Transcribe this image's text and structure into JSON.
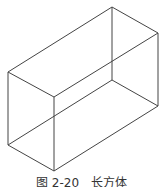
{
  "figure": {
    "stroke": "#444444",
    "vertices": {
      "top_left": [
        8,
        72
      ],
      "top_back": [
        112,
        7
      ],
      "top_right": [
        158,
        33
      ],
      "top_front": [
        54,
        97
      ],
      "bottom_left": [
        8,
        145
      ],
      "bottom_back": [
        112,
        80
      ],
      "bottom_right": [
        158,
        106
      ],
      "bottom_front": [
        54,
        171
      ]
    },
    "edges": [
      [
        "top_left",
        "top_back"
      ],
      [
        "top_back",
        "top_right"
      ],
      [
        "top_right",
        "top_front"
      ],
      [
        "top_front",
        "top_left"
      ],
      [
        "bottom_left",
        "bottom_front"
      ],
      [
        "bottom_front",
        "bottom_right"
      ],
      [
        "bottom_right",
        "bottom_back"
      ],
      [
        "bottom_back",
        "bottom_left"
      ],
      [
        "top_left",
        "bottom_left"
      ],
      [
        "top_front",
        "bottom_front"
      ],
      [
        "top_right",
        "bottom_right"
      ],
      [
        "top_back",
        "bottom_back"
      ]
    ]
  },
  "caption": "图 2-20　长方体"
}
